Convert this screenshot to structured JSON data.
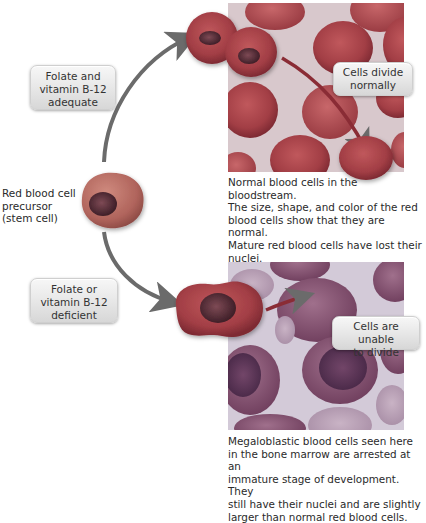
{
  "labels": {
    "adequate": {
      "line1": "Folate and",
      "line2": "vitamin B-12",
      "line3": "adequate"
    },
    "deficient": {
      "line1": "Folate or",
      "line2": "vitamin B-12",
      "line3": "deficient"
    },
    "stem_cell": {
      "line1": "Red blood cell",
      "line2": "precursor",
      "line3": "(stem cell)"
    },
    "divide_normally": {
      "line1": "Cells divide",
      "line2": "normally"
    },
    "unable_to_divide": {
      "line1": "Cells are unable",
      "line2": "to divide"
    }
  },
  "captions": {
    "normal": [
      "Normal blood cells in the bloodstream.",
      "The size, shape, and color of the red",
      "blood cells show that they are normal.",
      "Mature red blood cells have lost their",
      "nuclei."
    ],
    "megaloblastic": [
      "Megaloblastic blood cells seen here",
      "in the bone marrow are arrested at an",
      "immature stage of development. They",
      "still have their nuclei and are slightly",
      "larger than normal red blood cells."
    ]
  },
  "colors": {
    "arrow": "#6b6b6b",
    "normal_bg": "#d9c9cf",
    "normal_cell": "#a8454b",
    "mega_bg": "#cfc6d6",
    "mega_cell": "#8a5a78",
    "stem_cell": "#b76a62",
    "nucleus": "#5c2f38"
  }
}
